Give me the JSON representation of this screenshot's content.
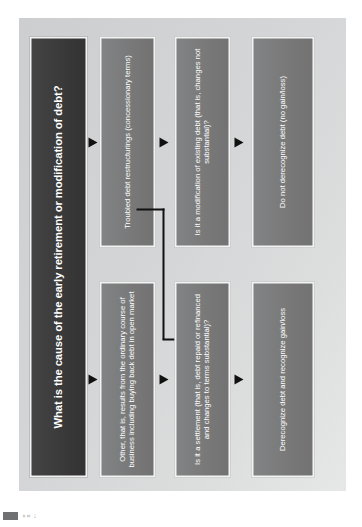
{
  "slide": {
    "background_color": "#ffffff",
    "panel_color": "#d2d3d4"
  },
  "diagram": {
    "orientation": "rotated-90-counterclockwise",
    "colors": {
      "title_box": "#3b3b3b",
      "node_box": "#7b7c7d",
      "node_border": "#f3f3f3",
      "text": "#ffffff",
      "connector": "#111111"
    },
    "nodes": [
      {
        "id": "title",
        "label": "What is the cause of the early retirement or modification of debt?",
        "style": "dark",
        "column": 1
      },
      {
        "id": "other",
        "label": "Other, that is, results from the ordinary course of business including buying back debt in open market",
        "style": "grey",
        "column": 2,
        "branch": "upper"
      },
      {
        "id": "tdr",
        "label": "Troubled debt restructurings (concessionary terms)",
        "style": "grey",
        "column": 2,
        "branch": "lower"
      },
      {
        "id": "settlement",
        "label": "Is it a settlement (that is, debt repaid or refinanced and changes to terms substantial)?",
        "style": "grey",
        "column": 3,
        "branch": "upper"
      },
      {
        "id": "modification",
        "label": "Is it a modification of existing debt (that is, changes not substantial)?",
        "style": "grey",
        "column": 3,
        "branch": "lower"
      },
      {
        "id": "derecognize",
        "label": "Derecognize debt and recognize gain/loss",
        "style": "grey",
        "column": 4,
        "branch": "upper"
      },
      {
        "id": "no-derecognize",
        "label": "Do not derecognize debt (no gain/loss)",
        "style": "grey",
        "column": 4,
        "branch": "lower"
      }
    ],
    "connectors": [
      {
        "from": "title",
        "to": "other",
        "type": "straight-arrow"
      },
      {
        "from": "title",
        "to": "tdr",
        "type": "straight-arrow"
      },
      {
        "from": "other",
        "to": "settlement",
        "type": "straight-arrow"
      },
      {
        "from": "tdr",
        "to": "modification",
        "type": "straight-arrow"
      },
      {
        "from": "tdr",
        "to": "settlement",
        "type": "elbow-arrow"
      },
      {
        "from": "settlement",
        "to": "derecognize",
        "type": "straight-arrow"
      },
      {
        "from": "modification",
        "to": "no-derecognize",
        "type": "straight-arrow"
      }
    ]
  },
  "corner_mark": {
    "swatch_color": "#6f7071",
    "glyphs": [
      "»",
      "s",
      "←"
    ]
  }
}
